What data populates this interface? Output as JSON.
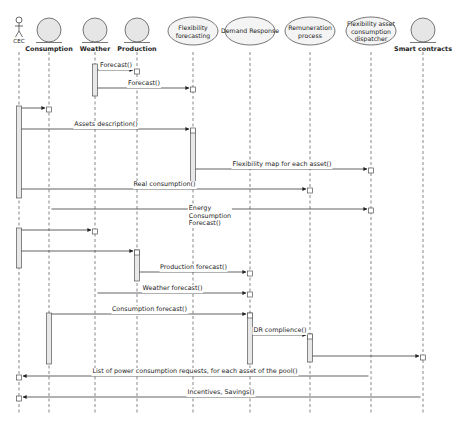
{
  "diagram": {
    "type": "UML sequence diagram",
    "participants": [
      {
        "id": "cec",
        "label": "CEC",
        "kind": "actor",
        "x": 19
      },
      {
        "id": "consumption",
        "label": "Consumption",
        "kind": "entity",
        "x": 49
      },
      {
        "id": "weather",
        "label": "Weather",
        "kind": "entity",
        "x": 95
      },
      {
        "id": "production",
        "label": "Production",
        "kind": "entity",
        "x": 137
      },
      {
        "id": "flex_forecasting",
        "label": "Flexibility\nforecasting",
        "kind": "usecase",
        "x": 193
      },
      {
        "id": "demand_response",
        "label": "Demand Response",
        "kind": "usecase",
        "x": 250
      },
      {
        "id": "remuneration",
        "label": "Remuneration\nprocess",
        "kind": "usecase",
        "x": 310
      },
      {
        "id": "dispatcher",
        "label": "Flexibility asset\nconsumption\ndispatcher",
        "kind": "usecase",
        "x": 371
      },
      {
        "id": "smart_contracts",
        "label": "Smart contracts",
        "kind": "entity",
        "x": 423
      }
    ],
    "messages": [
      {
        "label": "Forecast()",
        "from": "weather",
        "to": "production",
        "y": 70
      },
      {
        "label": "Forecast()",
        "from": "weather",
        "to": "flex_forecasting",
        "y": 88
      },
      {
        "label": "",
        "from": "cec",
        "to": "consumption",
        "y": 108
      },
      {
        "label": "Assets description()",
        "from": "cec",
        "to": "flex_forecasting",
        "y": 129
      },
      {
        "label": "Flexibility map for each asset()",
        "from": "flex_forecasting",
        "to": "dispatcher",
        "y": 169
      },
      {
        "label": "Real consumption()",
        "from": "cec",
        "to": "remuneration",
        "y": 189
      },
      {
        "label": "Energy\nConsumption\nForecast()",
        "from": "consumption",
        "to": "dispatcher",
        "y": 209
      },
      {
        "label": "",
        "from": "cec",
        "to": "weather",
        "y": 230
      },
      {
        "label": "",
        "from": "cec",
        "to": "production",
        "y": 251
      },
      {
        "label": "Production forecast()",
        "from": "production",
        "to": "demand_response",
        "y": 272
      },
      {
        "label": "Weather forecast()",
        "from": "weather",
        "to": "demand_response",
        "y": 293
      },
      {
        "label": "Consumption forecast()",
        "from": "consumption",
        "to": "demand_response",
        "y": 314
      },
      {
        "label": "DR complience()",
        "from": "demand_response",
        "to": "remuneration",
        "y": 335
      },
      {
        "label": "",
        "from": "remuneration",
        "to": "smart_contracts",
        "y": 356
      },
      {
        "label": "List of power consumption requests, for each asset of the pool()",
        "from": "dispatcher",
        "to": "cec",
        "y": 376
      },
      {
        "label": "Incentives, Savings()",
        "from": "smart_contracts",
        "to": "cec",
        "y": 397
      }
    ],
    "colors": {
      "line": "#3a3a3a",
      "lifeline": "#555555",
      "entity_fill": "#e6e6e6",
      "activation_fill": "#e8e8e8",
      "background": "#ffffff"
    }
  }
}
